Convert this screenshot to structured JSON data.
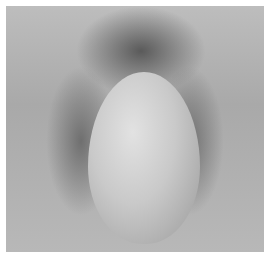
{
  "image": {
    "description": "Grayscale photograph with no visible text or UI elements"
  },
  "colors": {
    "background": "#ffffff",
    "midtone": "#b0b0b0",
    "shadow": "#6f6f6f",
    "highlight": "#e2e2e2"
  }
}
